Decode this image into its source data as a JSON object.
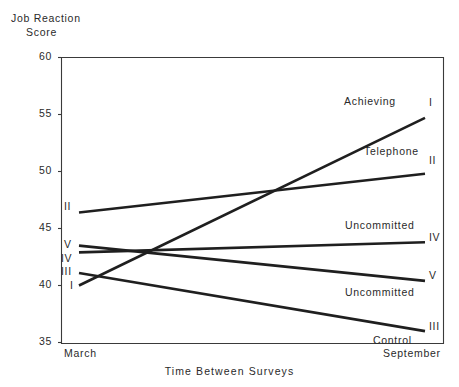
{
  "chart_data": {
    "type": "line",
    "title": "",
    "ylabel": "Job Reaction Score",
    "ylabel_line1": "Job Reaction",
    "ylabel_line2": "Score",
    "xlabel": "Time Between Surveys",
    "x": [
      "March",
      "September"
    ],
    "xtick_labels": [
      "March",
      "September"
    ],
    "ytick_labels": [
      "60",
      "55",
      "50",
      "45",
      "40",
      "35"
    ],
    "yticks": [
      60,
      55,
      50,
      45,
      40,
      35
    ],
    "ylim": [
      35,
      60
    ],
    "grid": false,
    "legend": "inline-end-labels",
    "line_color": "#1f1f1f",
    "series": [
      {
        "name": "Achieving",
        "roman": "I",
        "values": [
          40.0,
          54.7
        ]
      },
      {
        "name": "Telephone",
        "roman": "II",
        "values": [
          46.4,
          49.8
        ]
      },
      {
        "name": "Control",
        "roman": "III",
        "values": [
          41.1,
          36.0
        ]
      },
      {
        "name": "Uncommitted",
        "roman": "IV",
        "values": [
          42.9,
          43.8
        ]
      },
      {
        "name": "Uncommitted",
        "roman": "V",
        "values": [
          43.5,
          40.4
        ]
      }
    ],
    "left_roman_labels": [
      {
        "roman": "II",
        "value": 46.4
      },
      {
        "roman": "V",
        "value": 43.5
      },
      {
        "roman": "IV",
        "value": 42.9
      },
      {
        "roman": "III",
        "value": 41.1
      },
      {
        "roman": "I",
        "value": 40.0
      }
    ],
    "right_roman_labels": [
      {
        "roman": "I",
        "value": 54.7
      },
      {
        "roman": "II",
        "value": 49.8
      },
      {
        "roman": "IV",
        "value": 43.8
      },
      {
        "roman": "V",
        "value": 40.4
      },
      {
        "roman": "III",
        "value": 36.0
      }
    ],
    "annotations": [
      {
        "text": "Achieving",
        "series": "I"
      },
      {
        "text": "Telephone",
        "series": "II"
      },
      {
        "text": "Uncommitted",
        "series": "IV"
      },
      {
        "text": "Uncommitted",
        "series": "V"
      },
      {
        "text": "Control",
        "series": "III"
      }
    ]
  },
  "ylabels": {
    "t60": "60",
    "t55": "55",
    "t50": "50",
    "t45": "45",
    "t40": "40",
    "t35": "35"
  },
  "xlabels": {
    "march": "March",
    "september": "September"
  },
  "titles": {
    "y_line1": "Job Reaction",
    "y_line2": "Score",
    "x_axis": "Time Between Surveys"
  },
  "left_romans": {
    "r_ii": "II",
    "r_v": "V",
    "r_iv": "IV",
    "r_iii": "III",
    "r_i": "I"
  },
  "right_romans": {
    "r_i": "I",
    "r_ii": "II",
    "r_iv": "IV",
    "r_v": "V",
    "r_iii": "III"
  },
  "names": {
    "achieving": "Achieving",
    "telephone": "Telephone",
    "uncommitted_iv": "Uncommitted",
    "uncommitted_v": "Uncommitted",
    "control": "Control"
  }
}
